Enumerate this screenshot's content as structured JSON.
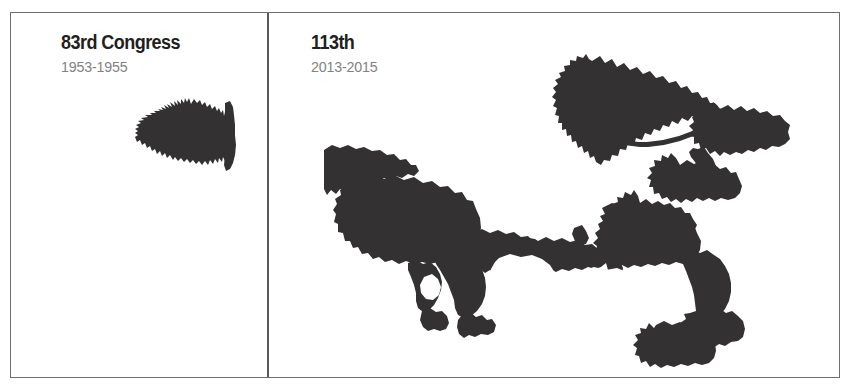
{
  "figure": {
    "type": "district-comparison",
    "panels": [
      {
        "id": "left",
        "title": "83rd Congress",
        "years": "1953-1955",
        "district_shape": "compact-blob"
      },
      {
        "id": "right",
        "title": "113th",
        "years": "2013-2015",
        "district_shape": "gerrymandered-sprawl"
      }
    ]
  },
  "colors": {
    "district_fill": "#333132",
    "frame_border": "#6f6f6f",
    "divider": "#595959",
    "title_text": "#231f20",
    "years_text": "#828282",
    "background": "#ffffff"
  }
}
